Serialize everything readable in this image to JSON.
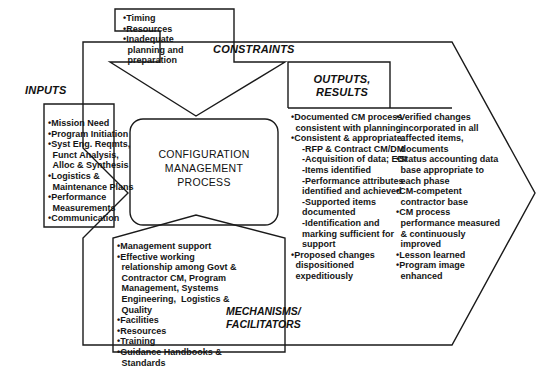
{
  "diagram": {
    "type": "IDEF0 process diagram",
    "center": {
      "title": "CONFIGURATION\nMANAGEMENT\nPROCESS"
    },
    "constraints": {
      "label": "CONSTRAINTS",
      "items": [
        {
          "text": "Timing",
          "level": 0,
          "bullet": true
        },
        {
          "text": "Resources",
          "level": 0,
          "bullet": true
        },
        {
          "text": "Inadequate",
          "level": 0,
          "bullet": true
        },
        {
          "text": "planning and",
          "level": 0,
          "bullet": false
        },
        {
          "text": "preparation",
          "level": 0,
          "bullet": false
        }
      ]
    },
    "inputs": {
      "label": "INPUTS",
      "items": [
        {
          "text": "Mission Need",
          "level": 0,
          "bullet": true
        },
        {
          "text": "Program Initiation",
          "level": 0,
          "bullet": true
        },
        {
          "text": "Syst Eng. Reqmts,",
          "level": 0,
          "bullet": true
        },
        {
          "text": "Funct Analysis,",
          "level": 0,
          "bullet": false
        },
        {
          "text": "Alloc & Synthesis",
          "level": 0,
          "bullet": false
        },
        {
          "text": "Logistics &",
          "level": 0,
          "bullet": true
        },
        {
          "text": "Maintenance Plans",
          "level": 0,
          "bullet": false
        },
        {
          "text": "Performance",
          "level": 0,
          "bullet": true
        },
        {
          "text": "Measurements",
          "level": 0,
          "bullet": false
        },
        {
          "text": "Communication",
          "level": 0,
          "bullet": true
        }
      ]
    },
    "outputs": {
      "label": "OUTPUTS,\nRESULTS",
      "column_one": [
        {
          "text": "Documented CM process",
          "level": 0,
          "bullet": true
        },
        {
          "text": "consistent with planning",
          "level": 0,
          "bullet": false
        },
        {
          "text": "Consistent & appropriate:",
          "level": 0,
          "bullet": true
        },
        {
          "text": "-RFP & Contract CM/DM",
          "level": 1,
          "bullet": false
        },
        {
          "text": "-Acquisition of data; EDI",
          "level": 1,
          "bullet": false
        },
        {
          "text": "-Items identified",
          "level": 1,
          "bullet": false
        },
        {
          "text": "-Performance attributes",
          "level": 1,
          "bullet": false
        },
        {
          "text": "identified and achieved",
          "level": 1,
          "bullet": false,
          "cont": true
        },
        {
          "text": "-Supported items",
          "level": 1,
          "bullet": false
        },
        {
          "text": "documented",
          "level": 1,
          "bullet": false,
          "cont": true
        },
        {
          "text": "-Identification and",
          "level": 1,
          "bullet": false
        },
        {
          "text": "marking sufficient for",
          "level": 1,
          "bullet": false,
          "cont": true
        },
        {
          "text": "support",
          "level": 1,
          "bullet": false,
          "cont": true
        },
        {
          "text": "Proposed changes",
          "level": 0,
          "bullet": true
        },
        {
          "text": "dispositioned",
          "level": 0,
          "bullet": false
        },
        {
          "text": "expeditiously",
          "level": 0,
          "bullet": false
        }
      ],
      "column_two": [
        {
          "text": "Verified changes",
          "level": 0,
          "bullet": true
        },
        {
          "text": "incorporated in all",
          "level": 0,
          "bullet": false
        },
        {
          "text": "affected items,",
          "level": 0,
          "bullet": false
        },
        {
          "text": "documents",
          "level": 0,
          "bullet": false
        },
        {
          "text": "Status accounting data",
          "level": 0,
          "bullet": true
        },
        {
          "text": "base appropriate to",
          "level": 0,
          "bullet": false
        },
        {
          "text": "each phase",
          "level": 0,
          "bullet": false
        },
        {
          "text": "CM-competent",
          "level": 0,
          "bullet": true
        },
        {
          "text": "contractor base",
          "level": 0,
          "bullet": false
        },
        {
          "text": "CM process",
          "level": 0,
          "bullet": true
        },
        {
          "text": "performance measured",
          "level": 0,
          "bullet": false
        },
        {
          "text": "& continuously",
          "level": 0,
          "bullet": false
        },
        {
          "text": "improved",
          "level": 0,
          "bullet": false
        },
        {
          "text": "Lesson learned",
          "level": 0,
          "bullet": true
        },
        {
          "text": "Program image",
          "level": 0,
          "bullet": true
        },
        {
          "text": "enhanced",
          "level": 0,
          "bullet": false
        }
      ]
    },
    "mechanisms": {
      "label": "MECHANISMS/\nFACILITATORS",
      "items": [
        {
          "text": "Management support",
          "level": 0,
          "bullet": true
        },
        {
          "text": "Effective working",
          "level": 0,
          "bullet": true
        },
        {
          "text": "relationship among Govt &",
          "level": 0,
          "bullet": false
        },
        {
          "text": "Contractor CM, Program",
          "level": 0,
          "bullet": false
        },
        {
          "text": "Management, Systems",
          "level": 0,
          "bullet": false
        },
        {
          "text": "Engineering,  Logistics &",
          "level": 0,
          "bullet": false
        },
        {
          "text": "Quality",
          "level": 0,
          "bullet": false
        },
        {
          "text": "Facilities",
          "level": 0,
          "bullet": true
        },
        {
          "text": "Resources",
          "level": 0,
          "bullet": true
        },
        {
          "text": "Training",
          "level": 0,
          "bullet": true
        },
        {
          "text": "Guidance Handbooks &",
          "level": 0,
          "bullet": true
        },
        {
          "text": "Standards",
          "level": 0,
          "bullet": false
        }
      ]
    },
    "colors": {
      "stroke": "#1a1a1a",
      "text": "#141414",
      "background": "#ffffff"
    }
  }
}
